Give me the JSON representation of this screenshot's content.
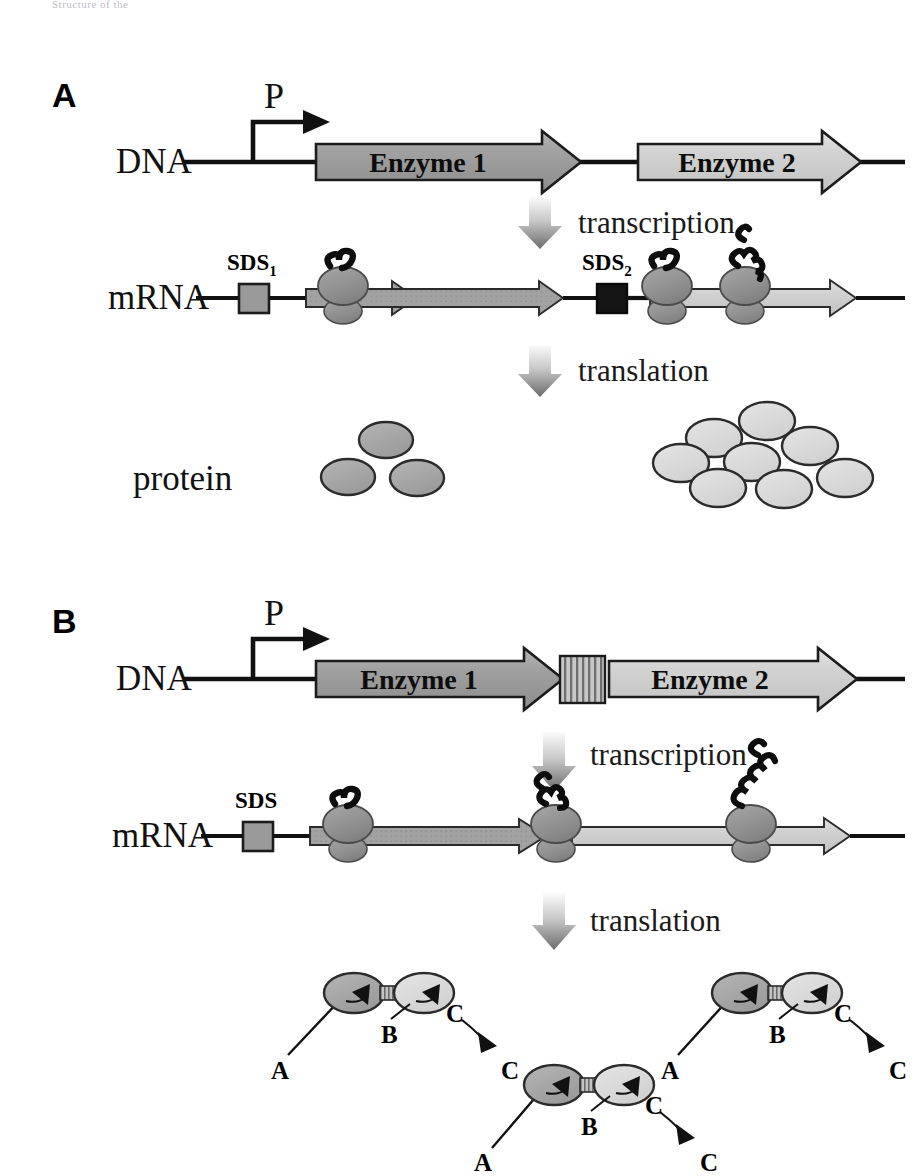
{
  "figure": {
    "top_cut_text": "Structure of the",
    "panels": [
      {
        "id": "A",
        "label": "A",
        "rows": [
          {
            "name": "dna",
            "label": "DNA"
          },
          {
            "name": "mrna",
            "label": "mRNA"
          },
          {
            "name": "protein",
            "label": "protein"
          }
        ],
        "promoter_label": "P",
        "genes": [
          {
            "name": "Enzyme 1",
            "fill": "#a0a0a0"
          },
          {
            "name": "Enzyme 2",
            "fill": "#d2d2d2"
          }
        ],
        "sds_sites": [
          {
            "label": "SDS",
            "subscript": "1",
            "fill": "#9a9a9a"
          },
          {
            "label": "SDS",
            "subscript": "2",
            "fill": "#141414"
          }
        ],
        "steps": [
          {
            "label": "transcription"
          },
          {
            "label": "translation"
          }
        ],
        "ribosome_counts": {
          "enzyme1_mrna": 1,
          "enzyme2_mrna": 2
        },
        "protein_products": [
          {
            "gene": "Enzyme 1",
            "count": 3,
            "fill": "#a8a8a8"
          },
          {
            "gene": "Enzyme 2",
            "count": 8,
            "fill": "#d8d8d8"
          }
        ]
      },
      {
        "id": "B",
        "label": "B",
        "rows": [
          {
            "name": "dna",
            "label": "DNA"
          },
          {
            "name": "mrna",
            "label": "mRNA"
          }
        ],
        "promoter_label": "P",
        "genes": [
          {
            "name": "Enzyme 1",
            "fill": "#a0a0a0"
          },
          {
            "name": "linker",
            "fill": "#b4b4b4",
            "pattern": "vertical-stripes"
          },
          {
            "name": "Enzyme 2",
            "fill": "#d2d2d2"
          }
        ],
        "sds_sites": [
          {
            "label": "SDS",
            "subscript": "",
            "fill": "#9a9a9a"
          }
        ],
        "steps": [
          {
            "label": "transcription"
          },
          {
            "label": "translation"
          }
        ],
        "ribosome_counts": {
          "fused_mrna": 3
        },
        "fusion_complexes": [
          {
            "substrate": "A",
            "junction": "B",
            "product_from": "C",
            "product_to": "C"
          },
          {
            "substrate": "A",
            "junction": "B",
            "product_from": "C",
            "product_to": "C"
          },
          {
            "substrate": "A",
            "junction": "B",
            "product_from": "C",
            "product_to": "C"
          }
        ]
      }
    ],
    "colors": {
      "enzyme1_gray": "#a0a0a0",
      "enzyme2_gray": "#d2d2d2",
      "ribosome_dark": "#8e8e8e",
      "outline": "#1c1c1c",
      "arrow_gradient_top": "#f2f2f2",
      "arrow_gradient_bottom": "#6e6e6e",
      "background": "#ffffff"
    }
  }
}
